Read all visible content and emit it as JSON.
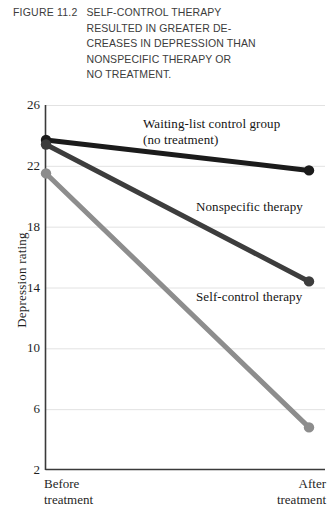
{
  "caption": {
    "figure_label": "FIGURE 11.2",
    "lines": [
      "SELF-CONTROL THERAPY",
      "RESULTED IN GREATER DE-",
      "CREASES IN DEPRESSION THAN",
      "NONSPECIFIC THERAPY OR",
      "NO TREATMENT."
    ]
  },
  "chart_data": {
    "type": "line",
    "title": "",
    "xlabel": "",
    "ylabel": "Depression rating",
    "categories": [
      "Before treatment",
      "After treatment"
    ],
    "x_tick_labels": [
      {
        "line1": "Before",
        "line2": "treatment"
      },
      {
        "line1": "After",
        "line2": "treatment"
      }
    ],
    "ylim": [
      2,
      26
    ],
    "y_ticks": [
      26,
      22,
      18,
      14,
      10,
      6,
      2
    ],
    "grid": true,
    "grid_axis": "y",
    "legend_position": "inline-annotations",
    "series": [
      {
        "name": "Waiting-list control group (no treatment)",
        "annotation_line1": "Waiting-list control group",
        "annotation_line2": "(no treatment)",
        "color": "#1b1b1b",
        "values": [
          23.7,
          21.7
        ]
      },
      {
        "name": "Nonspecific therapy",
        "annotation_line1": "Nonspecific therapy",
        "annotation_line2": "",
        "color": "#3d3d3d",
        "values": [
          23.4,
          14.4
        ]
      },
      {
        "name": "Self-control therapy",
        "annotation_line1": "Self-control therapy",
        "annotation_line2": "",
        "color": "#8d8d8d",
        "values": [
          21.5,
          4.8
        ]
      }
    ]
  },
  "colors": {
    "axis": "#3a3a3a",
    "grid": "#e2e2e2",
    "text": "#1f1f1f",
    "caption_text": "#3c3c3c"
  }
}
